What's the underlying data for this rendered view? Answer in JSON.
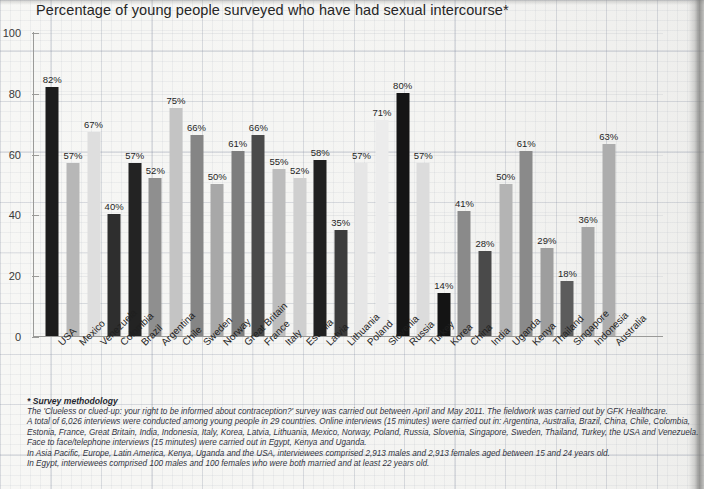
{
  "chart_title": "Percentage of young people surveyed who have had sexual intercourse*",
  "chart_data": {
    "type": "bar",
    "title": "Percentage of young people surveyed who have had sexual intercourse*",
    "xlabel": "",
    "ylabel": "",
    "ylim": [
      0,
      100
    ],
    "yticks": [
      0,
      20,
      40,
      60,
      80,
      100
    ],
    "grid": true,
    "legend": "none",
    "value_suffix": "%",
    "categories": [
      "USA",
      "Mexico",
      "Venezuela",
      "Colombia",
      "Brazil",
      "Argentina",
      "Chile",
      "Sweden",
      "Norway",
      "Great Britain",
      "France",
      "Italy",
      "Estonia",
      "Latvia",
      "Lithuania",
      "Poland",
      "Slovenia",
      "Russia",
      "Turkey",
      "Korea",
      "China",
      "India",
      "Uganda",
      "Kenya",
      "Thailand",
      "Singapore",
      "Indonesia",
      "Australia"
    ],
    "values": [
      82,
      57,
      67,
      40,
      57,
      52,
      75,
      66,
      50,
      61,
      66,
      55,
      52,
      58,
      35,
      57,
      71,
      80,
      57,
      14,
      41,
      28,
      50,
      61,
      29,
      18,
      36,
      63
    ],
    "value_labels": [
      "82%",
      "57%",
      "67%",
      "40%",
      "57%",
      "52%",
      "75%",
      "66%",
      "50%",
      "61%",
      "66%",
      "55%",
      "52%",
      "58%",
      "35%",
      "57%",
      "71%",
      "80%",
      "57%",
      "14%",
      "41%",
      "28%",
      "50%",
      "61%",
      "29%",
      "18%",
      "36%",
      "63%"
    ],
    "bar_colors": [
      "#1c1c1c",
      "#b7b7b7",
      "#dedede",
      "#2e2e2e",
      "#232323",
      "#8f8f8f",
      "#c4c4c4",
      "#858585",
      "#a8a8a8",
      "#7d7d7d",
      "#4a4a4a",
      "#bcbcbc",
      "#cfcfcf",
      "#212121",
      "#3c3c3c",
      "#e6e6e6",
      "#ececec",
      "#151515",
      "#dcdcdc",
      "#141414",
      "#8a8a8a",
      "#4a4a4a",
      "#b4b4b4",
      "#8a8a8a",
      "#9e9e9e",
      "#5c5c5c",
      "#a5a5a5",
      "#adadad"
    ]
  },
  "footnote": {
    "title": "* Survey methodology",
    "lines": [
      "The 'Clueless or clued-up: your right to be informed about contraception?' survey was carried out between April and May 2011. The fieldwork was carried out by GFK Healthcare.",
      "A total of 6,026 interviews were conducted among young people in 29 countries. Online interviews (15 minutes) were carried out in: Argentina, Australia, Brazil, China, Chile, Colombia,",
      "Estonia, France, Great Britain, India, Indonesia, Italy, Korea, Latvia, Lithuania, Mexico, Norway, Poland, Russia, Slovenia, Singapore, Sweden, Thailand, Turkey, the USA and Venezuela.",
      "Face to face/telephone interviews (15 minutes) were carried out in Egypt, Kenya and Uganda.",
      "In Asia Pacific, Europe, Latin America, Kenya, Uganda and the USA, interviewees comprised 2,913 males and 2,913 females aged between 15 and 24 years old.",
      "In Egypt, interviewees comprised 100 males and 100 females who were both married and at least 22 years old."
    ]
  }
}
